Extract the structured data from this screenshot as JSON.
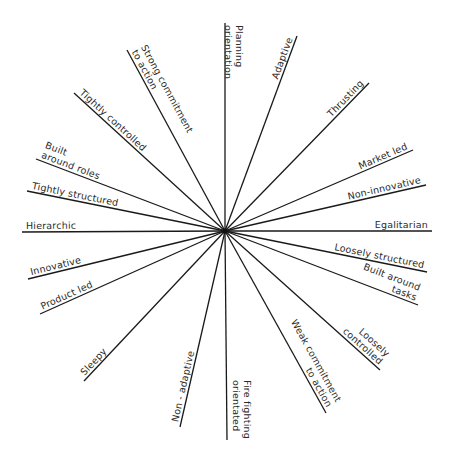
{
  "diagram": {
    "type": "radial-spoke",
    "title": "",
    "center": {
      "x": 225,
      "y": 231
    },
    "line_color": "#1a1a1a",
    "text_color": "#2a2a2a",
    "spokes": [
      {
        "id": "planning-orientation",
        "lines": [
          "Planning",
          "orientation"
        ],
        "end": {
          "x": 225,
          "y": 23
        }
      },
      {
        "id": "adaptive",
        "lines": [
          "Adaptive"
        ],
        "end": {
          "x": 297,
          "y": 36
        }
      },
      {
        "id": "thrusting",
        "lines": [
          "Thrusting"
        ],
        "end": {
          "x": 369,
          "y": 83
        }
      },
      {
        "id": "market-led",
        "lines": [
          "Market led"
        ],
        "end": {
          "x": 413,
          "y": 150
        }
      },
      {
        "id": "non-innovative",
        "lines": [
          "Non-innovative"
        ],
        "end": {
          "x": 426,
          "y": 185
        }
      },
      {
        "id": "egalitarian",
        "lines": [
          "Egalitarian"
        ],
        "end": {
          "x": 432,
          "y": 231
        }
      },
      {
        "id": "loosely-structured",
        "lines": [
          "Loosely structured"
        ],
        "end": {
          "x": 427,
          "y": 272
        }
      },
      {
        "id": "built-around-tasks",
        "lines": [
          "Built around",
          "tasks"
        ],
        "end": {
          "x": 418,
          "y": 305
        }
      },
      {
        "id": "loosely-controlled",
        "lines": [
          "Loosely",
          "controlled"
        ],
        "end": {
          "x": 380,
          "y": 370
        }
      },
      {
        "id": "weak-commitment-to-action",
        "lines": [
          "Weak commitment",
          "to action"
        ],
        "end": {
          "x": 326,
          "y": 413
        }
      },
      {
        "id": "fire-fighting-orientated",
        "lines": [
          "Fire fighting",
          "orientated"
        ],
        "end": {
          "x": 227,
          "y": 440
        }
      },
      {
        "id": "non-adaptive",
        "lines": [
          "Non - adaptive"
        ],
        "end": {
          "x": 180,
          "y": 427
        }
      },
      {
        "id": "sleepy",
        "lines": [
          "Sleepy"
        ],
        "end": {
          "x": 84,
          "y": 381
        }
      },
      {
        "id": "product-led",
        "lines": [
          "Product led"
        ],
        "end": {
          "x": 40,
          "y": 314
        }
      },
      {
        "id": "innovative",
        "lines": [
          "Innovative"
        ],
        "end": {
          "x": 28,
          "y": 279
        }
      },
      {
        "id": "hierarchic",
        "lines": [
          "Hierarchic"
        ],
        "end": {
          "x": 22,
          "y": 232
        }
      },
      {
        "id": "tightly-structured",
        "lines": [
          "Tightly structured"
        ],
        "end": {
          "x": 27,
          "y": 191
        }
      },
      {
        "id": "built-around-roles",
        "lines": [
          "Built",
          "around roles"
        ],
        "end": {
          "x": 36,
          "y": 159
        }
      },
      {
        "id": "tightly-controlled",
        "lines": [
          "Tightly controlled"
        ],
        "end": {
          "x": 74,
          "y": 93
        }
      },
      {
        "id": "strong-commitment-to-action",
        "lines": [
          "Strong commitment",
          "to action"
        ],
        "end": {
          "x": 127,
          "y": 50
        }
      }
    ]
  }
}
